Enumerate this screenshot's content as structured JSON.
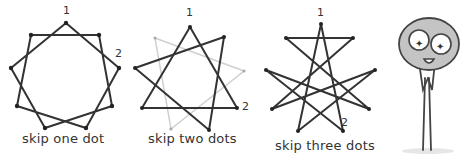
{
  "panels": [
    {
      "id": "skip-one",
      "caption": "skip one dot",
      "label_1": "1",
      "label_2": "2",
      "star": "{9/2}"
    },
    {
      "id": "skip-two",
      "caption": "skip two dots",
      "label_1": "1",
      "label_2": "2",
      "star": "{9/3}"
    },
    {
      "id": "skip-three",
      "caption": "skip three dots",
      "label_1": "1",
      "label_2": "2",
      "star": "{9/4}"
    }
  ],
  "colors": {
    "line": "#333333",
    "faint_line": "#cccccc",
    "figure_head": "#bdbdbd",
    "figure_outline": "#444444"
  }
}
